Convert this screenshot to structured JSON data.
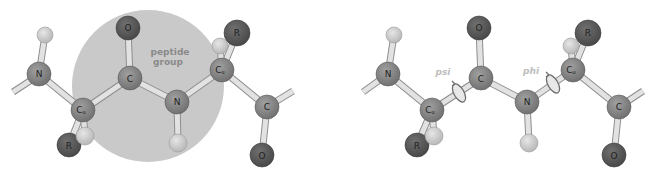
{
  "colors": {
    "background": "#ffffff",
    "peptide_group_disk": "#c9c9c9",
    "atom_backbone": "#7d7d7d",
    "atom_oxygen_r": "#555555",
    "atom_hydrogen": "#c8c8c8",
    "bond_fill": "#e2e2e2",
    "bond_stroke": "#8e8e8e",
    "label_text": "#1e1e1e",
    "angle_label": "#bdbdbd"
  },
  "left_panel": {
    "group_label_line1": "peptide",
    "group_label_line2": "group",
    "atoms": {
      "n1": "N",
      "h_n1": "",
      "ca1": "C",
      "ca1_sub": "α",
      "r1": "R",
      "h_ca1": "",
      "c1": "C",
      "o1": "O",
      "n2": "N",
      "h_n2": "",
      "ca2": "C",
      "ca2_sub": "α",
      "r2": "R",
      "h_ca2": "",
      "c2": "C",
      "o2": "O"
    }
  },
  "right_panel": {
    "psi_label": "psi",
    "phi_label": "phi",
    "atoms": {
      "n1": "N",
      "ca1": "C",
      "ca1_sub": "α",
      "r1": "R",
      "c1": "C",
      "o1": "O",
      "n2": "N",
      "ca2": "C",
      "ca2_sub": "α",
      "r2": "R",
      "c2": "C",
      "o2": "O"
    }
  }
}
